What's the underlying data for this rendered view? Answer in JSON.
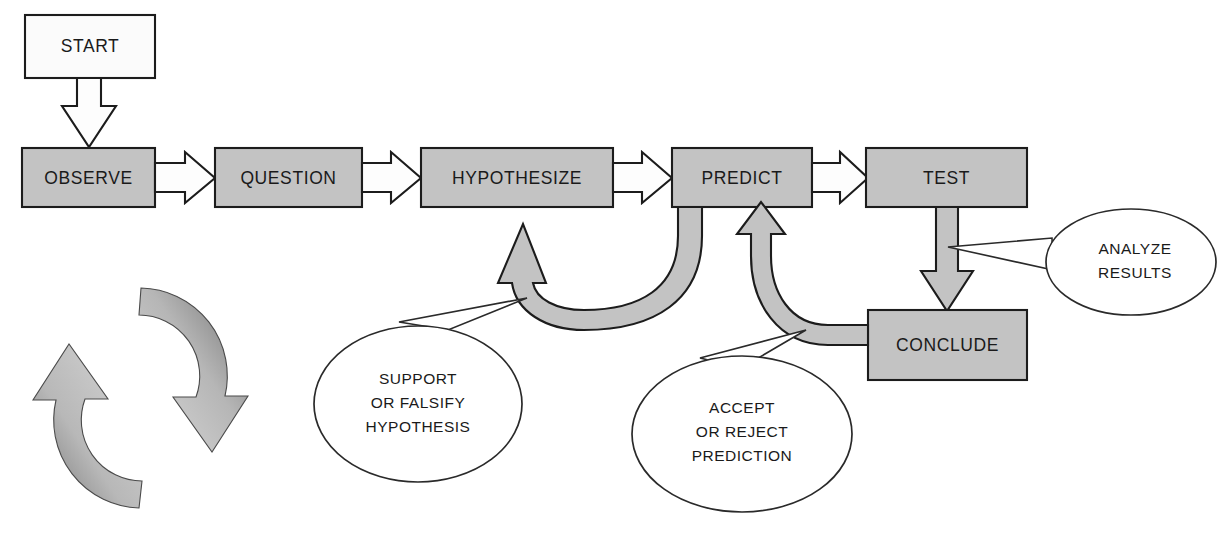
{
  "diagram": {
    "stages": [
      {
        "id": "start",
        "label": "START",
        "fill": "white"
      },
      {
        "id": "observe",
        "label": "OBSERVE",
        "fill": "gray"
      },
      {
        "id": "question",
        "label": "QUESTION",
        "fill": "gray"
      },
      {
        "id": "hypothesize",
        "label": "HYPOTHESIZE",
        "fill": "gray"
      },
      {
        "id": "predict",
        "label": "PREDICT",
        "fill": "gray"
      },
      {
        "id": "test",
        "label": "TEST",
        "fill": "gray"
      },
      {
        "id": "conclude",
        "label": "CONCLUDE",
        "fill": "gray"
      }
    ],
    "callouts": [
      {
        "id": "support-or-falsify",
        "lines": [
          "SUPPORT",
          "OR FALSIFY",
          "HYPOTHESIS"
        ],
        "points_to": "hypothesize-feedback-arrow"
      },
      {
        "id": "accept-or-reject",
        "lines": [
          "ACCEPT",
          "OR REJECT",
          "PREDICTION"
        ],
        "points_to": "predict-feedback-arrow"
      },
      {
        "id": "analyze-results",
        "lines": [
          "ANALYZE",
          "RESULTS"
        ],
        "points_to": "test-to-conclude-arrow"
      }
    ],
    "connectors": [
      {
        "id": "start-to-observe",
        "from": "START",
        "to": "OBSERVE",
        "style": "white-block-arrow",
        "direction": "down"
      },
      {
        "id": "observe-to-question",
        "from": "OBSERVE",
        "to": "QUESTION",
        "style": "white-block-arrow",
        "direction": "right"
      },
      {
        "id": "question-to-hypothesize",
        "from": "QUESTION",
        "to": "HYPOTHESIZE",
        "style": "white-block-arrow",
        "direction": "right"
      },
      {
        "id": "hypothesize-to-predict",
        "from": "HYPOTHESIZE",
        "to": "PREDICT",
        "style": "white-block-arrow",
        "direction": "right"
      },
      {
        "id": "predict-to-test",
        "from": "PREDICT",
        "to": "TEST",
        "style": "white-block-arrow",
        "direction": "right"
      },
      {
        "id": "test-to-conclude",
        "from": "TEST",
        "to": "CONCLUDE",
        "style": "gray-block-arrow",
        "direction": "down"
      },
      {
        "id": "predict-to-hypothesize",
        "from": "PREDICT",
        "to": "HYPOTHESIZE",
        "style": "gray-curved-arrow",
        "direction": "loop-back"
      },
      {
        "id": "conclude-to-predict",
        "from": "CONCLUDE",
        "to": "PREDICT",
        "style": "gray-curved-arrow",
        "direction": "loop-back"
      }
    ],
    "cycle_icon": {
      "id": "cycle-icon",
      "description": "two-arrow circular recycle symbol",
      "arrow_count": 2
    },
    "colors": {
      "box_gray": "#c3c3c3",
      "box_white": "#fbfbfb",
      "outline": "#1c1c1c",
      "text": "#1a1a1a",
      "callout_stroke": "#2a2a2a"
    }
  }
}
